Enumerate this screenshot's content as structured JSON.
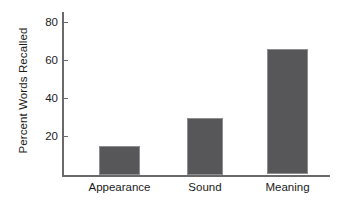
{
  "chart_data": {
    "type": "bar",
    "title": "",
    "subtitle": "",
    "xlabel": "",
    "ylabel": "Percent Words Recalled",
    "categories": [
      "Appearance",
      "Sound",
      "Meaning"
    ],
    "values": [
      15,
      30,
      66
    ],
    "series": [
      {
        "name": "Percent Words Recalled",
        "values": [
          15,
          30,
          66
        ]
      }
    ],
    "ylim": [
      0,
      88
    ],
    "ytick_labels": [
      "20",
      "40",
      "60",
      "80"
    ],
    "ytick_values": [
      20,
      40,
      60,
      80
    ],
    "grid": false,
    "legend": false,
    "legend_position": "none",
    "bar_color": "#57575a",
    "bar_edge_color": "#8e8e90",
    "axis_color": "#6a6a6a",
    "background_color": "#ffffff",
    "text_color": "#1b1b1b"
  }
}
